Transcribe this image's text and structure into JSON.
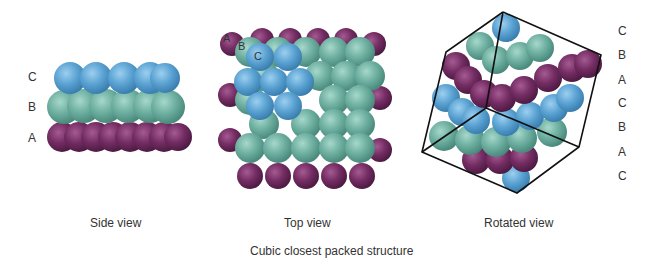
{
  "figure": {
    "title": "Cubic closest packed structure",
    "colors": {
      "layer_A": "#6e2a5e",
      "layer_B": "#6aae9e",
      "layer_C": "#5aa2d2",
      "cube_edge": "#111111",
      "text": "#333333"
    },
    "panels": [
      {
        "id": "side",
        "caption": "Side view",
        "layer_labels": [
          "C",
          "B",
          "A"
        ]
      },
      {
        "id": "top",
        "caption": "Top view",
        "layer_labels": [
          "A",
          "B",
          "C"
        ]
      },
      {
        "id": "rotated",
        "caption": "Rotated view",
        "layer_labels": [
          "C",
          "B",
          "A",
          "C",
          "B",
          "A",
          "C"
        ]
      }
    ]
  }
}
